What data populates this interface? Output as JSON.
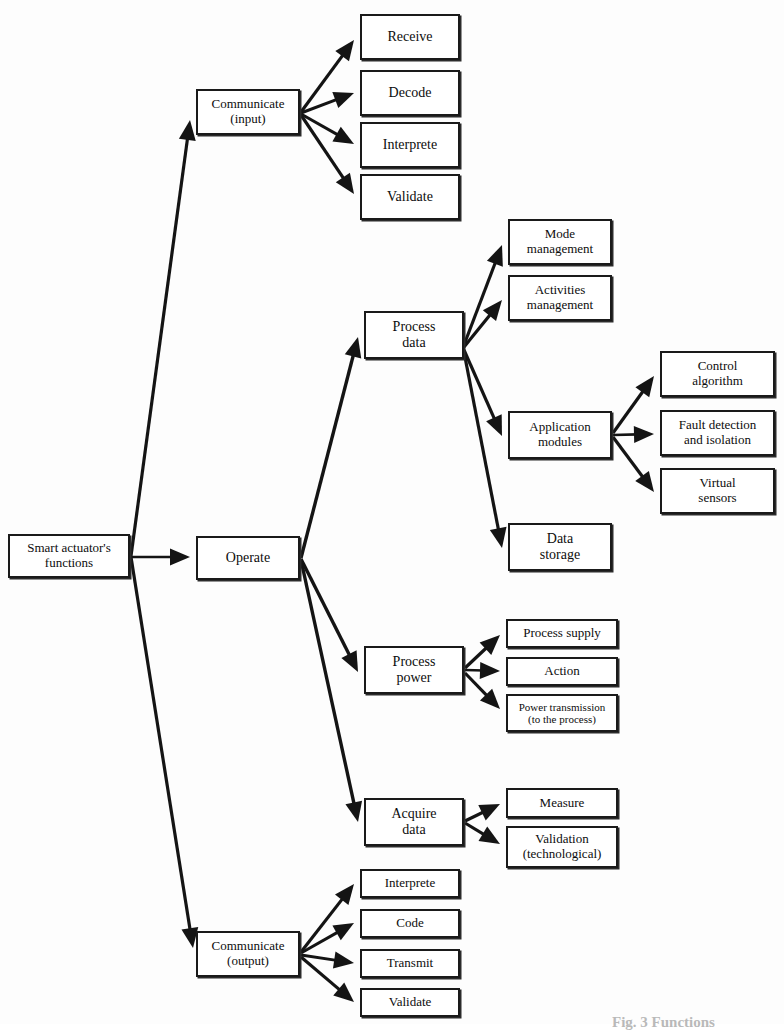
{
  "figure": {
    "kind": "functional-decomposition-tree",
    "caption": "Fig. 3 Functions",
    "line_color": "#141414",
    "box_border_color": "#1a1a1a",
    "box_fill_color": "#ffffff",
    "background_color": "#fdfdfd"
  },
  "nodes": [
    {
      "id": "root",
      "label": "Smart actuator's\nfunctions",
      "x": 8,
      "y": 534,
      "w": 122,
      "h": 44,
      "font": 13
    },
    {
      "id": "comm_in",
      "label": "Communicate\n(input)",
      "x": 196,
      "y": 89,
      "w": 104,
      "h": 46,
      "font": 13
    },
    {
      "id": "operate",
      "label": "Operate",
      "x": 196,
      "y": 536,
      "w": 104,
      "h": 44,
      "font": 14
    },
    {
      "id": "comm_out",
      "label": "Communicate\n(output)",
      "x": 196,
      "y": 931,
      "w": 104,
      "h": 46,
      "font": 13
    },
    {
      "id": "receive",
      "label": "Receive",
      "x": 360,
      "y": 14,
      "w": 100,
      "h": 46,
      "font": 14
    },
    {
      "id": "decode",
      "label": "Decode",
      "x": 360,
      "y": 70,
      "w": 100,
      "h": 46,
      "font": 14
    },
    {
      "id": "interprete1",
      "label": "Interprete",
      "x": 360,
      "y": 122,
      "w": 100,
      "h": 46,
      "font": 14
    },
    {
      "id": "validate1",
      "label": "Validate",
      "x": 360,
      "y": 174,
      "w": 100,
      "h": 46,
      "font": 14
    },
    {
      "id": "proc_data",
      "label": "Process\ndata",
      "x": 364,
      "y": 311,
      "w": 100,
      "h": 48,
      "font": 14
    },
    {
      "id": "proc_power",
      "label": "Process\npower",
      "x": 364,
      "y": 646,
      "w": 100,
      "h": 48,
      "font": 14
    },
    {
      "id": "acq_data",
      "label": "Acquire\ndata",
      "x": 364,
      "y": 798,
      "w": 100,
      "h": 48,
      "font": 14
    },
    {
      "id": "mode_mgmt",
      "label": "Mode\nmanagement",
      "x": 508,
      "y": 219,
      "w": 104,
      "h": 46,
      "font": 13
    },
    {
      "id": "act_mgmt",
      "label": "Activities\nmanagement",
      "x": 508,
      "y": 275,
      "w": 104,
      "h": 46,
      "font": 13
    },
    {
      "id": "app_mod",
      "label": "Application\nmodules",
      "x": 508,
      "y": 411,
      "w": 104,
      "h": 48,
      "font": 13
    },
    {
      "id": "data_store",
      "label": "Data\nstorage",
      "x": 508,
      "y": 523,
      "w": 104,
      "h": 48,
      "font": 14
    },
    {
      "id": "ctrl_algo",
      "label": "Control\nalgorithm",
      "x": 660,
      "y": 351,
      "w": 115,
      "h": 46,
      "font": 13
    },
    {
      "id": "fault_det",
      "label": "Fault detection\nand isolation",
      "x": 660,
      "y": 410,
      "w": 115,
      "h": 46,
      "font": 13
    },
    {
      "id": "virt_sens",
      "label": "Virtual\nsensors",
      "x": 660,
      "y": 468,
      "w": 115,
      "h": 46,
      "font": 13
    },
    {
      "id": "proc_supply",
      "label": "Process supply",
      "x": 506,
      "y": 619,
      "w": 112,
      "h": 29,
      "font": 13
    },
    {
      "id": "action",
      "label": "Action",
      "x": 506,
      "y": 657,
      "w": 112,
      "h": 29,
      "font": 13
    },
    {
      "id": "power_trans",
      "label": "Power transmission\n(to the process)",
      "x": 506,
      "y": 694,
      "w": 112,
      "h": 38,
      "font": 11
    },
    {
      "id": "measure",
      "label": "Measure",
      "x": 506,
      "y": 788,
      "w": 112,
      "h": 30,
      "font": 13
    },
    {
      "id": "validation",
      "label": "Validation\n(technological)",
      "x": 506,
      "y": 826,
      "w": 112,
      "h": 42,
      "font": 13
    },
    {
      "id": "interprete2",
      "label": "Interprete",
      "x": 360,
      "y": 869,
      "w": 100,
      "h": 29,
      "font": 13
    },
    {
      "id": "code",
      "label": "Code",
      "x": 360,
      "y": 909,
      "w": 100,
      "h": 29,
      "font": 13
    },
    {
      "id": "transmit",
      "label": "Transmit",
      "x": 360,
      "y": 949,
      "w": 100,
      "h": 29,
      "font": 13
    },
    {
      "id": "validate2",
      "label": "Validate",
      "x": 360,
      "y": 988,
      "w": 100,
      "h": 29,
      "font": 13
    }
  ],
  "edges": [
    {
      "from": "root",
      "to": "comm_in",
      "x1": 131,
      "y1": 556,
      "x2": 190,
      "y2": 120,
      "w": 3.2
    },
    {
      "from": "root",
      "to": "operate",
      "x1": 131,
      "y1": 557,
      "x2": 190,
      "y2": 557,
      "w": 2.6
    },
    {
      "from": "root",
      "to": "comm_out",
      "x1": 131,
      "y1": 557,
      "x2": 193,
      "y2": 948,
      "w": 3.2
    },
    {
      "from": "comm_in",
      "to": "receive",
      "x1": 301,
      "y1": 112,
      "x2": 354,
      "y2": 40,
      "w": 3.2
    },
    {
      "from": "comm_in",
      "to": "decode",
      "x1": 301,
      "y1": 113,
      "x2": 354,
      "y2": 93,
      "w": 3.0
    },
    {
      "from": "comm_in",
      "to": "interprete1",
      "x1": 301,
      "y1": 114,
      "x2": 354,
      "y2": 144,
      "w": 3.0
    },
    {
      "from": "comm_in",
      "to": "validate1",
      "x1": 301,
      "y1": 115,
      "x2": 354,
      "y2": 194,
      "w": 3.2
    },
    {
      "from": "operate",
      "to": "proc_data",
      "x1": 301,
      "y1": 558,
      "x2": 358,
      "y2": 337,
      "w": 3.4
    },
    {
      "from": "operate",
      "to": "proc_power",
      "x1": 301,
      "y1": 559,
      "x2": 358,
      "y2": 672,
      "w": 3.4
    },
    {
      "from": "operate",
      "to": "acq_data",
      "x1": 301,
      "y1": 560,
      "x2": 358,
      "y2": 822,
      "w": 3.4
    },
    {
      "from": "proc_data",
      "to": "mode_mgmt",
      "x1": 464,
      "y1": 345,
      "x2": 502,
      "y2": 245,
      "w": 3.2
    },
    {
      "from": "proc_data",
      "to": "act_mgmt",
      "x1": 464,
      "y1": 347,
      "x2": 502,
      "y2": 300,
      "w": 3.2
    },
    {
      "from": "proc_data",
      "to": "app_mod",
      "x1": 464,
      "y1": 350,
      "x2": 502,
      "y2": 436,
      "w": 3.2
    },
    {
      "from": "proc_data",
      "to": "data_store",
      "x1": 464,
      "y1": 352,
      "x2": 502,
      "y2": 548,
      "w": 3.2
    },
    {
      "from": "app_mod",
      "to": "ctrl_algo",
      "x1": 613,
      "y1": 433,
      "x2": 654,
      "y2": 376,
      "w": 3.2
    },
    {
      "from": "app_mod",
      "to": "fault_det",
      "x1": 613,
      "y1": 435,
      "x2": 654,
      "y2": 434,
      "w": 2.6
    },
    {
      "from": "app_mod",
      "to": "virt_sens",
      "x1": 613,
      "y1": 437,
      "x2": 654,
      "y2": 492,
      "w": 3.2
    },
    {
      "from": "proc_power",
      "to": "proc_supply",
      "x1": 465,
      "y1": 668,
      "x2": 500,
      "y2": 635,
      "w": 3.2
    },
    {
      "from": "proc_power",
      "to": "action",
      "x1": 465,
      "y1": 670,
      "x2": 500,
      "y2": 671,
      "w": 2.6
    },
    {
      "from": "proc_power",
      "to": "power_trans",
      "x1": 465,
      "y1": 673,
      "x2": 500,
      "y2": 709,
      "w": 3.2
    },
    {
      "from": "acq_data",
      "to": "measure",
      "x1": 465,
      "y1": 821,
      "x2": 500,
      "y2": 804,
      "w": 3.2
    },
    {
      "from": "acq_data",
      "to": "validation",
      "x1": 465,
      "y1": 823,
      "x2": 500,
      "y2": 844,
      "w": 3.2
    },
    {
      "from": "comm_out",
      "to": "interprete2",
      "x1": 301,
      "y1": 952,
      "x2": 354,
      "y2": 884,
      "w": 3.2
    },
    {
      "from": "comm_out",
      "to": "code",
      "x1": 301,
      "y1": 953,
      "x2": 354,
      "y2": 923,
      "w": 3.0
    },
    {
      "from": "comm_out",
      "to": "transmit",
      "x1": 301,
      "y1": 955,
      "x2": 354,
      "y2": 963,
      "w": 3.0
    },
    {
      "from": "comm_out",
      "to": "validate2",
      "x1": 301,
      "y1": 957,
      "x2": 354,
      "y2": 1002,
      "w": 3.2
    }
  ]
}
